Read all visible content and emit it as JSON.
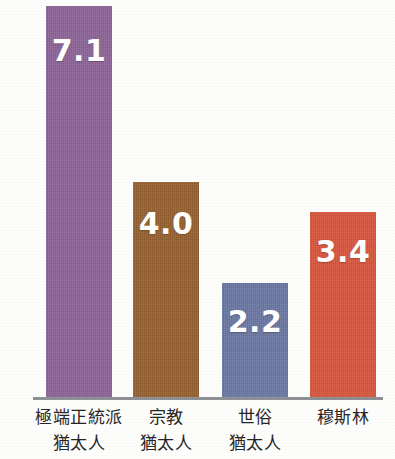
{
  "chart_data": {
    "type": "bar",
    "title": "",
    "subtitle": "",
    "xlabel": "",
    "ylabel": "",
    "ylim": [
      0,
      7.2
    ],
    "grid": false,
    "legend": null,
    "categories": [
      "極端正統派猶太人",
      "宗教猶太人",
      "世俗猶太人",
      "穆斯林"
    ],
    "category_lines": [
      [
        "極端正統派",
        "猶太人"
      ],
      [
        "宗教",
        "猶太人"
      ],
      [
        "世俗",
        "猶太人"
      ],
      [
        "穆斯林"
      ]
    ],
    "values": [
      7.1,
      4.0,
      2.2,
      3.4
    ],
    "value_labels": [
      "7.1",
      "4.0",
      "2.2",
      "3.4"
    ],
    "colors": [
      "#8d6397",
      "#96602f",
      "#6a77a3",
      "#d9553c"
    ],
    "baseline_color": "#8d9095",
    "label_color": "#262626",
    "value_label_color": "#ffffff",
    "background": "#fdfdfc"
  },
  "bars": [
    {
      "category": "極端正統派猶太人",
      "line1": "極端正統派",
      "line2": "猶太人",
      "value": 7.1,
      "value_label": "7.1",
      "color": "#8d6397",
      "color_name": "purple",
      "left": 46,
      "width": 66,
      "height": 393,
      "label_top": 30,
      "label_left": 23,
      "label_width": 112
    },
    {
      "category": "宗教猶太人",
      "line1": "宗教",
      "line2": "猶太人",
      "value": 4.0,
      "value_label": "4.0",
      "color": "#96602f",
      "color_name": "brown",
      "left": 133,
      "width": 66,
      "height": 217,
      "label_top": 27,
      "label_left": 112,
      "label_width": 108
    },
    {
      "category": "世俗猶太人",
      "line1": "世俗",
      "line2": "猶太人",
      "value": 2.2,
      "value_label": "2.2",
      "color": "#6a77a3",
      "color_name": "slate-blue",
      "left": 222,
      "width": 66,
      "height": 116,
      "label_top": 24,
      "label_left": 201,
      "label_width": 108
    },
    {
      "category": "穆斯林",
      "line1": "穆斯林",
      "line2": "",
      "value": 3.4,
      "value_label": "3.4",
      "color": "#d9553c",
      "color_name": "red-orange",
      "left": 310,
      "width": 66,
      "height": 187,
      "label_top": 25,
      "label_left": 297,
      "label_width": 92
    }
  ]
}
